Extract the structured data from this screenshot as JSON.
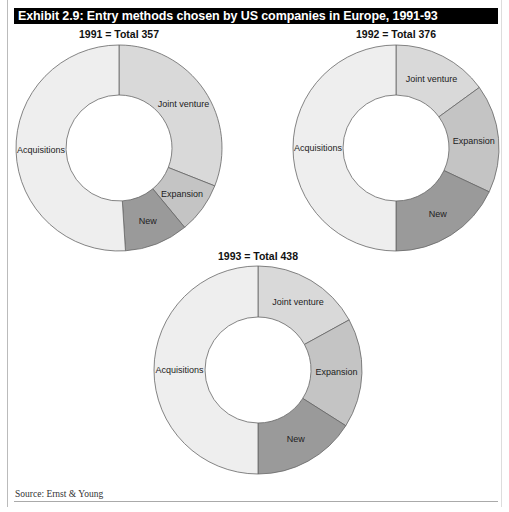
{
  "title": "Exhibit 2.9: Entry methods chosen by US companies in Europe, 1991-93",
  "source": "Source: Ernst & Young",
  "colors": {
    "Joint venture": "#d9d9d9",
    "Expansion": "#c4c4c4",
    "New": "#9a9a9a",
    "Acquisitions": "#eeeeee",
    "stroke": "#666666"
  },
  "chart_data": [
    {
      "type": "pie",
      "variant": "donut",
      "title": "1991 = Total 357",
      "year": 1991,
      "total": 357,
      "categories": [
        "Joint venture",
        "Expansion",
        "New",
        "Acquisitions"
      ],
      "values_pct": [
        31,
        8,
        10,
        51
      ]
    },
    {
      "type": "pie",
      "variant": "donut",
      "title": "1992 = Total 376",
      "year": 1992,
      "total": 376,
      "categories": [
        "Joint venture",
        "Expansion",
        "New",
        "Acquisitions"
      ],
      "values_pct": [
        15,
        17,
        18,
        50
      ]
    },
    {
      "type": "pie",
      "variant": "donut",
      "title": "1993 = Total 438",
      "year": 1993,
      "total": 438,
      "categories": [
        "Joint venture",
        "Expansion",
        "New",
        "Acquisitions"
      ],
      "values_pct": [
        17,
        17,
        16,
        50
      ]
    }
  ]
}
